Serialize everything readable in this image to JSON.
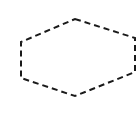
{
  "diagram": {
    "shape": "hexagon",
    "style": "dashed-outline",
    "stroke_color": "#1a1a1a",
    "fill_color": "none",
    "background": "#ffffff",
    "vertices": [
      [
        75,
        19
      ],
      [
        135,
        38
      ],
      [
        135,
        72
      ],
      [
        75,
        96
      ],
      [
        21,
        78
      ],
      [
        21,
        42
      ]
    ]
  }
}
